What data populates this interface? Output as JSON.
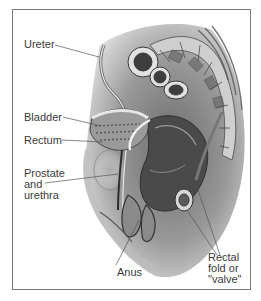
{
  "figure": {
    "style": "grayscale pencil medical illustration",
    "border_color": "#7a7a7a",
    "text_color": "#3a3a3a"
  },
  "labels": {
    "ureter": "Ureter",
    "bladder": "Bladder",
    "rectum": "Rectum",
    "prostate": "Prostate\nand\nurethra",
    "anus": "Anus",
    "rectal_fold": "Rectal\nfold or\n\"valve\""
  }
}
